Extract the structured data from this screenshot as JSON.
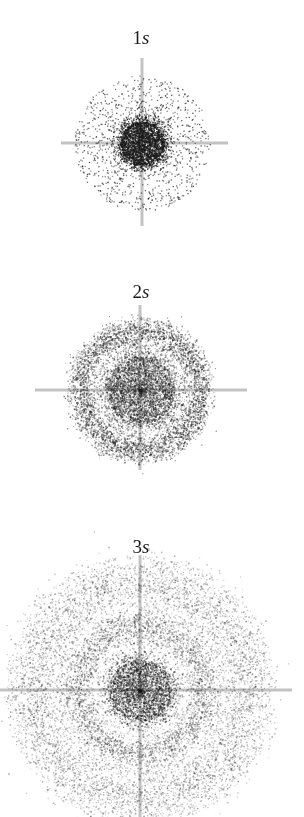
{
  "figure": {
    "width": 304,
    "height": 817,
    "background": "#ffffff",
    "dot_color": "#1a1a1a",
    "axis_color": "#b8b8b8"
  },
  "orbitals": [
    {
      "id": "1s",
      "label_n": "1",
      "label_l": "s",
      "label_x": 141,
      "label_y": 28,
      "center_x": 142,
      "center_y": 143,
      "axis": {
        "x_start": 61,
        "x_end": 228,
        "y_start": 58,
        "y_end": 226,
        "thickness": 3
      },
      "extent_radius": 68,
      "nodes": 0,
      "shells": [
        {
          "type": "core",
          "radius": 22,
          "count": 2600,
          "alpha": 0.95
        },
        {
          "type": "halo",
          "inner": 20,
          "outer": 68,
          "count": 1100,
          "alpha": 0.75,
          "dot_size": 1.3
        }
      ]
    },
    {
      "id": "2s",
      "label_n": "2",
      "label_l": "s",
      "label_x": 141,
      "label_y": 282,
      "center_x": 140,
      "center_y": 390,
      "axis": {
        "x_start": 35,
        "x_end": 247,
        "y_start": 305,
        "y_end": 470,
        "thickness": 3
      },
      "extent_radius": 72,
      "nodes": 1,
      "shells": [
        {
          "type": "core",
          "radius": 34,
          "count": 3200,
          "alpha": 0.55
        },
        {
          "type": "ring",
          "radius": 60,
          "width": 7,
          "count": 3000,
          "alpha": 0.6
        },
        {
          "type": "halo",
          "inner": 0,
          "outer": 74,
          "count": 2600,
          "alpha": 0.35
        }
      ]
    },
    {
      "id": "3s",
      "label_n": "3",
      "label_l": "s",
      "label_x": 141,
      "label_y": 537,
      "center_x": 140,
      "center_y": 690,
      "axis": {
        "x_start": 0,
        "x_end": 292,
        "y_start": 555,
        "y_end": 817,
        "thickness": 3
      },
      "extent_radius": 135,
      "nodes": 2,
      "shells": [
        {
          "type": "core",
          "radius": 31,
          "count": 2600,
          "alpha": 0.6
        },
        {
          "type": "ring",
          "radius": 64,
          "width": 9,
          "count": 2800,
          "alpha": 0.42
        },
        {
          "type": "ring",
          "radius": 108,
          "width": 14,
          "count": 4200,
          "alpha": 0.38
        },
        {
          "type": "halo",
          "inner": 0,
          "outer": 135,
          "count": 5200,
          "alpha": 0.25
        }
      ]
    }
  ]
}
